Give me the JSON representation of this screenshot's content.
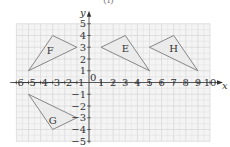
{
  "figure": {
    "top_fragment": "(i)"
  },
  "chart_data": {
    "type": "coordinate-grid",
    "title": "",
    "xlabel": "x",
    "ylabel": "y",
    "xlim": [
      -6,
      10
    ],
    "ylim": [
      -5,
      5
    ],
    "x_ticks": [
      -6,
      -5,
      -4,
      -3,
      -2,
      -1,
      1,
      2,
      3,
      4,
      5,
      6,
      7,
      8,
      9,
      10
    ],
    "y_ticks": [
      -5,
      -4,
      -3,
      -2,
      -1,
      1,
      2,
      3,
      4,
      5
    ],
    "origin_label": "0",
    "grid": {
      "major": 1,
      "minor": 0.5
    },
    "shapes": [
      {
        "name": "F",
        "vertices": [
          [
            -5,
            1
          ],
          [
            -3,
            4
          ],
          [
            -1,
            3
          ]
        ],
        "label_pos": [
          -3.2,
          2.7
        ]
      },
      {
        "name": "E",
        "vertices": [
          [
            1,
            3
          ],
          [
            3,
            4
          ],
          [
            5,
            1
          ]
        ],
        "label_pos": [
          3,
          2.9
        ]
      },
      {
        "name": "H",
        "vertices": [
          [
            5,
            3
          ],
          [
            7,
            4
          ],
          [
            9,
            1
          ]
        ],
        "label_pos": [
          7,
          2.9
        ]
      },
      {
        "name": "G",
        "vertices": [
          [
            -5,
            -1
          ],
          [
            -3,
            -4
          ],
          [
            -1,
            -3
          ]
        ],
        "label_pos": [
          -3,
          -3.2
        ]
      }
    ],
    "colors": {
      "grid_bg": "#f4f4f4",
      "grid_minor": "#e2e2e2",
      "grid_major": "#d0d0d0",
      "axis": "#333333",
      "shape_fill": "#ebebeb",
      "shape_stroke": "#7a7a7a"
    }
  }
}
